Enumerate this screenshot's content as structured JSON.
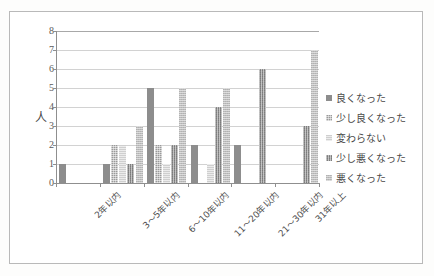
{
  "chart_data": {
    "type": "bar",
    "title": "",
    "subtitle": "",
    "xlabel": "",
    "ylabel": "人",
    "ylim": [
      0,
      8
    ],
    "ytick_labels": [
      "0",
      "1",
      "2",
      "3",
      "4",
      "5",
      "6",
      "7",
      "8"
    ],
    "grid": true,
    "legend_position": "right",
    "categories": [
      "2年以内",
      "3〜5年以内",
      "6〜10年以内",
      "11〜20年以内",
      "21〜30年以内",
      "31年以上"
    ],
    "series": [
      {
        "name": "良くなった",
        "color": "#8d8d8d",
        "values": [
          1,
          1,
          5,
          2,
          2,
          0
        ]
      },
      {
        "name": "少し良くなった",
        "color": "#9a9a9a",
        "values": [
          0,
          2,
          2,
          0,
          0,
          0
        ]
      },
      {
        "name": "変わらない",
        "color": "#cfcfcf",
        "values": [
          0,
          2,
          1,
          1,
          0,
          0
        ]
      },
      {
        "name": "少し悪くなった",
        "color": "#8a8a8a",
        "values": [
          0,
          1,
          2,
          4,
          6,
          3
        ]
      },
      {
        "name": "悪くなった",
        "color": "#bdbdbd",
        "values": [
          0,
          3,
          5,
          5,
          0,
          7
        ]
      }
    ]
  },
  "legend": {
    "items": [
      {
        "label": "良くなった"
      },
      {
        "label": "少し良くなった"
      },
      {
        "label": "変わらない"
      },
      {
        "label": "少し悪くなった"
      },
      {
        "label": "悪くなった"
      }
    ]
  }
}
